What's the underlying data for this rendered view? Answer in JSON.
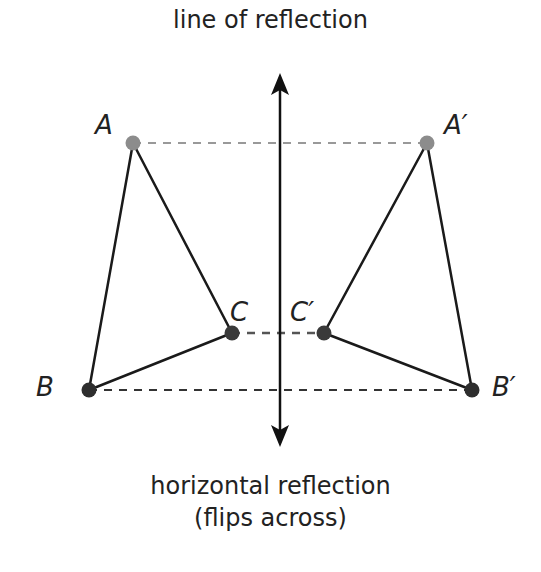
{
  "title": "line of reflection",
  "caption": {
    "line1": "horizontal reflection",
    "line2": "(flips across)"
  },
  "points": {
    "A": {
      "label": "A",
      "x": 133,
      "y": 143,
      "color": "#8c8c8c"
    },
    "B": {
      "label": "B",
      "x": 89,
      "y": 390,
      "color": "#333333"
    },
    "C": {
      "label": "C",
      "x": 232,
      "y": 333,
      "color": "#3a3a3a"
    },
    "A_prime": {
      "label": "A′",
      "x": 427,
      "y": 143,
      "color": "#8c8c8c"
    },
    "B_prime": {
      "label": "B′",
      "x": 472,
      "y": 390,
      "color": "#333333"
    },
    "C_prime": {
      "label": "C′",
      "x": 324,
      "y": 333,
      "color": "#3a3a3a"
    }
  },
  "colors": {
    "line": "#1a1a1a",
    "dash_light": "#999999",
    "dash_dark": "#444444"
  }
}
